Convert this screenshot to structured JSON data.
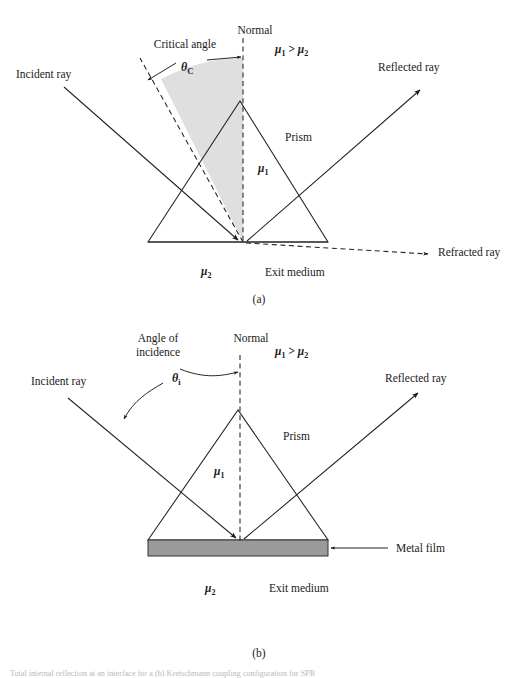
{
  "figure": {
    "title_caption": "",
    "caption_bottom": "Total internal reflection at an interface for a (b) Kretschmann coupling configuration for SPR",
    "background_color": "#ffffff",
    "ink_color": "#222222",
    "metal_film_color": "#9a9a9a",
    "cone_shade_color": "#dcdcdc"
  },
  "panel_a": {
    "panel_label": "(a)",
    "labels": {
      "normal": "Normal",
      "critical_angle": "Critical angle",
      "theta_symbol": "θ",
      "theta_subscript": "C",
      "index_relation_mu1": "μ",
      "index_relation_sub1": "1",
      "index_relation_gt": " > ",
      "index_relation_mu2": "μ",
      "index_relation_sub2": "2",
      "incident_ray": "Incident ray",
      "reflected_ray": "Reflected ray",
      "refracted_ray": "Refracted ray",
      "prism": "Prism",
      "mu1": "μ",
      "mu1_sub": "1",
      "mu2": "μ",
      "mu2_sub": "2",
      "exit_medium": "Exit medium"
    }
  },
  "panel_b": {
    "panel_label": "(b)",
    "labels": {
      "normal": "Normal",
      "angle_of_incidence_line1": "Angle of",
      "angle_of_incidence_line2": "incidence",
      "theta_symbol": "θ",
      "theta_subscript": "i",
      "index_relation_mu1": "μ",
      "index_relation_sub1": "1",
      "index_relation_gt": " > ",
      "index_relation_mu2": "μ",
      "index_relation_sub2": "2",
      "incident_ray": "Incident ray",
      "reflected_ray": "Reflected ray",
      "prism": "Prism",
      "mu1": "μ",
      "mu1_sub": "1",
      "mu2": "μ",
      "mu2_sub": "2",
      "exit_medium": "Exit medium",
      "metal_film": "Metal film"
    }
  }
}
